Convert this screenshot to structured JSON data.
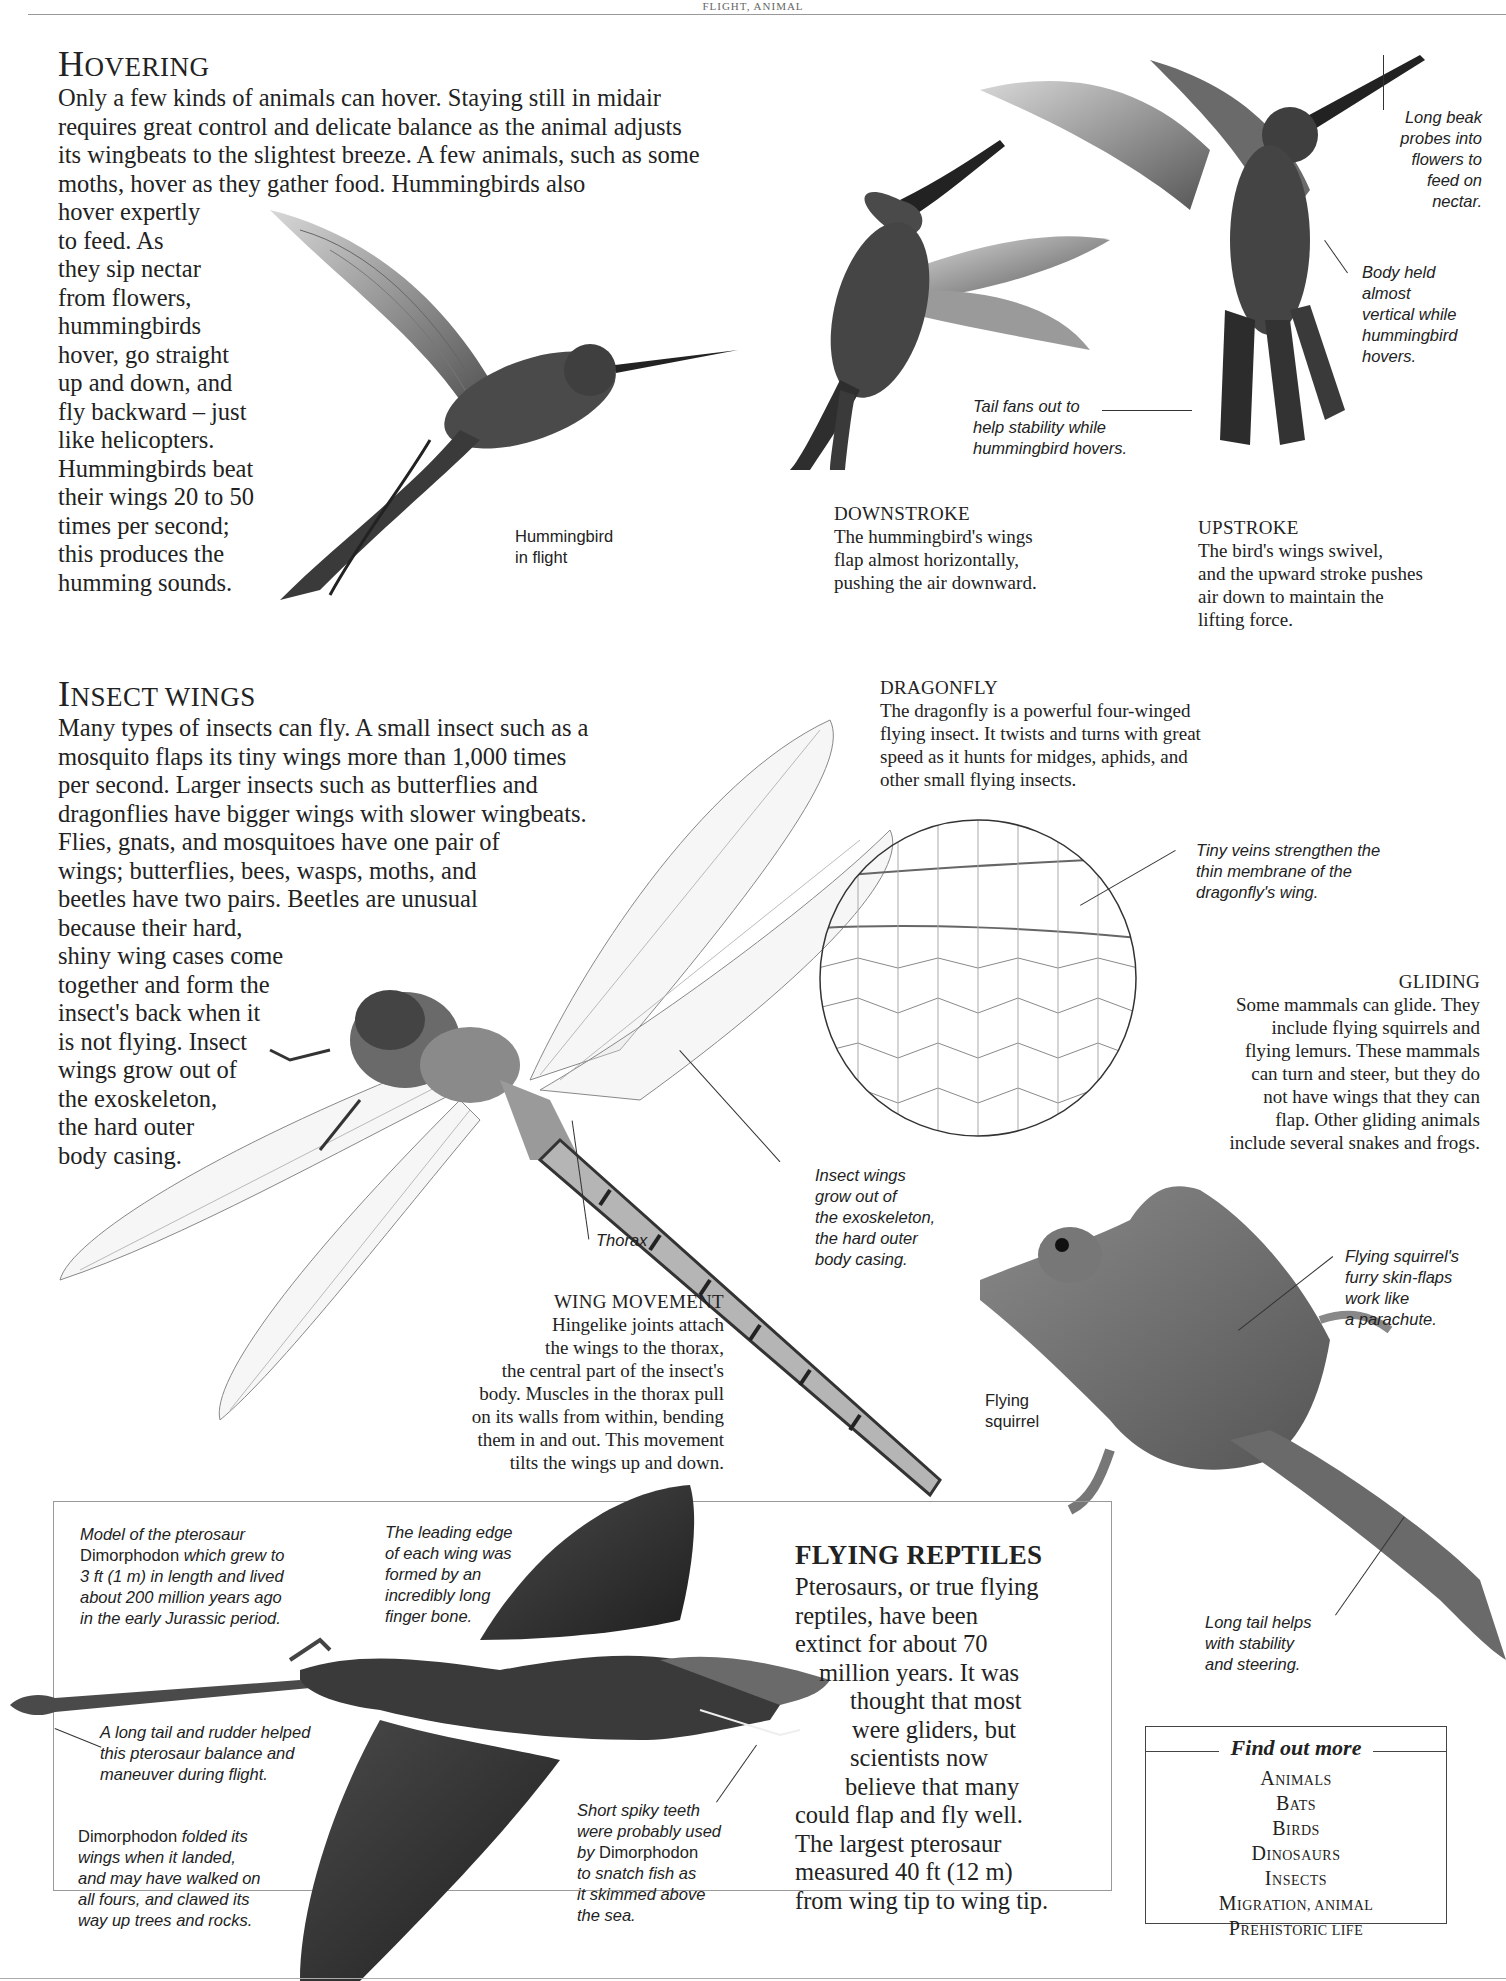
{
  "page": {
    "running_head": "FLIGHT, ANIMAL"
  },
  "hovering": {
    "title_cap": "H",
    "title_rest": "overing",
    "intro_lines": [
      "Only a few kinds of animals can hover. Staying still in midair",
      "requires great control and delicate balance as the animal adjusts",
      "its wingbeats to the slightest breeze. A few animals, such as some",
      "moths, hover as they gather food. Hummingbirds also"
    ],
    "column_lines": [
      "hover expertly",
      "to feed. As",
      "they sip nectar",
      "from flowers,",
      "hummingbirds",
      "hover, go straight",
      "up and down, and",
      "fly backward – just",
      "like helicopters.",
      "Hummingbirds beat",
      "their wings 20 to 50",
      "times per second;",
      "this produces the",
      "humming sounds."
    ],
    "labels": {
      "in_flight": [
        "Hummingbird",
        "in flight"
      ],
      "long_beak": [
        "Long beak",
        "probes into",
        "flowers to",
        "feed on",
        "nectar."
      ],
      "body_held": [
        "Body held",
        "almost",
        "vertical while",
        "hummingbird",
        "hovers."
      ],
      "tail_fans": [
        "Tail fans out to",
        "help stability while",
        "hummingbird hovers."
      ]
    },
    "downstroke": {
      "title": "DOWNSTROKE",
      "lines": [
        "The hummingbird's wings",
        "flap almost horizontally,",
        "pushing the air downward."
      ]
    },
    "upstroke": {
      "title": "UPSTROKE",
      "lines": [
        "The bird's wings swivel,",
        "and the upward stroke pushes",
        "air down to maintain the",
        "lifting force."
      ]
    }
  },
  "insect_wings": {
    "title_cap": "I",
    "title_rest": "nsect wings",
    "lines": [
      "Many types of insects can fly. A small insect such as a",
      "mosquito flaps its tiny wings more than 1,000 times",
      "per second. Larger insects such as butterflies and",
      "dragonflies have bigger wings with slower wingbeats.",
      "Flies, gnats, and mosquitoes have one pair of",
      "wings; butterflies, bees, wasps, moths, and",
      "beetles have two pairs. Beetles are unusual",
      "because their hard,",
      "shiny wing cases come",
      "together and form the",
      "insect's back when it",
      "is not flying. Insect",
      "wings grow out of",
      "the exoskeleton,",
      "the hard outer",
      "body casing."
    ],
    "dragonfly": {
      "title": "DRAGONFLY",
      "lines": [
        "The dragonfly is a powerful four-winged",
        "flying insect. It twists and turns with great",
        "speed as it hunts for midges, aphids, and",
        "other small flying insects."
      ]
    },
    "labels": {
      "tiny_veins": [
        "Tiny veins strengthen the",
        "thin membrane of the",
        "dragonfly's wing."
      ],
      "thorax": "Thorax",
      "wings_grow": [
        "Insect wings",
        "grow out of",
        "the exoskeleton,",
        "the hard outer",
        "body casing."
      ]
    },
    "wing_movement": {
      "title": "WING MOVEMENT",
      "lines": [
        "Hingelike joints attach",
        "the wings to the thorax,",
        "the central part of the insect's",
        "body. Muscles in the thorax pull",
        "on its walls from within, bending",
        "them in and out. This movement",
        "tilts the wings up and down."
      ]
    }
  },
  "gliding": {
    "title": "GLIDING",
    "lines": [
      "Some mammals can glide. They",
      "include flying squirrels and",
      "flying lemurs. These mammals",
      "can turn and steer, but they do",
      "not have wings that they can",
      "flap. Other gliding animals",
      "include several snakes and frogs."
    ],
    "labels": {
      "skin_flaps": [
        "Flying squirrel's",
        "furry skin-flaps",
        "work like",
        "a parachute."
      ],
      "flying_squirrel": [
        "Flying",
        "squirrel"
      ],
      "long_tail": [
        "Long tail helps",
        "with stability",
        "and steering."
      ]
    }
  },
  "flying_reptiles": {
    "title": "FLYING REPTILES",
    "lines": [
      "Pterosaurs, or true flying",
      "reptiles, have been",
      "extinct for about 70",
      "million years. It was",
      "thought that most",
      "were gliders, but",
      "scientists now",
      "believe that many",
      "could flap and fly well.",
      "The largest pterosaur",
      "measured 40 ft (12 m)",
      "from wing tip to wing tip."
    ],
    "labels": {
      "model": {
        "l1": "Model of the pterosaur",
        "l2_name": "Dimorphodon",
        "l2_rest": " which grew to",
        "l3": "3 ft (1 m) in length and lived",
        "l4": "about 200 million years ago",
        "l5": "in the early Jurassic period."
      },
      "leading_edge": [
        "The leading edge",
        "of each wing was",
        "formed by an",
        "incredibly long",
        "finger bone."
      ],
      "long_tail_rudder": [
        "A long tail and rudder helped",
        "this pterosaur balance and",
        "maneuver during flight."
      ],
      "folded": {
        "l1_name": "Dimorphodon",
        "l1_rest": " folded its",
        "l2": "wings when it landed,",
        "l3": "and may have walked on",
        "l4": "all fours, and clawed its",
        "l5": "way up trees and rocks."
      },
      "teeth": {
        "l1": "Short spiky teeth",
        "l2": "were probably used",
        "l3_pre": "by ",
        "l3_name": "Dimorphodon",
        "l4": "to snatch fish as",
        "l5": "it skimmed above",
        "l6": "the sea."
      }
    }
  },
  "find_out_more": {
    "title": "Find out more",
    "items": [
      {
        "cap": "A",
        "rest": "nimals"
      },
      {
        "cap": "B",
        "rest": "ats"
      },
      {
        "cap": "B",
        "rest": "irds"
      },
      {
        "cap": "D",
        "rest": "inosaurs"
      },
      {
        "cap": "I",
        "rest": "nsects"
      },
      {
        "cap": "M",
        "rest": "igration, animal"
      },
      {
        "cap": "P",
        "rest": "rehistoric life"
      }
    ]
  },
  "colors": {
    "text": "#222222",
    "rule": "#888888",
    "illustration_dark": "#3a3a3a",
    "illustration_mid": "#7a7a7a",
    "illustration_light": "#c8c8c8"
  }
}
